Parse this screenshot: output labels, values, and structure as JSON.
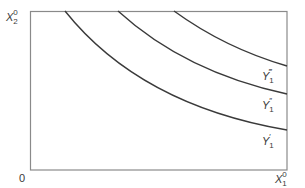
{
  "diagram": {
    "type": "indifference-curve-map",
    "axes": {
      "origin_label": "0",
      "x_axis_label": {
        "base": "X",
        "subscript": "1",
        "superscript": "0"
      },
      "y_axis_label": {
        "base": "X",
        "subscript": "2",
        "superscript": "0"
      }
    },
    "curves": [
      {
        "id": "Y1-prime",
        "label_base": "Y",
        "label_primes": "′",
        "label_subscript": "1",
        "start": [
          65,
          11
        ],
        "control": [
          140,
          105
        ],
        "end": [
          287,
          130
        ]
      },
      {
        "id": "Y1-double-prime",
        "label_base": "Y",
        "label_primes": "″",
        "label_subscript": "1",
        "start": [
          118,
          11
        ],
        "control": [
          185,
          72
        ],
        "end": [
          287,
          94
        ]
      },
      {
        "id": "Y1-triple-prime",
        "label_base": "Y",
        "label_primes": "‴",
        "label_subscript": "1",
        "start": [
          174,
          11
        ],
        "control": [
          225,
          48
        ],
        "end": [
          287,
          66
        ]
      }
    ],
    "colors": {
      "frame": "#8a8a8a",
      "curve": "#3a3a3a",
      "text": "#3a3a3a"
    }
  }
}
